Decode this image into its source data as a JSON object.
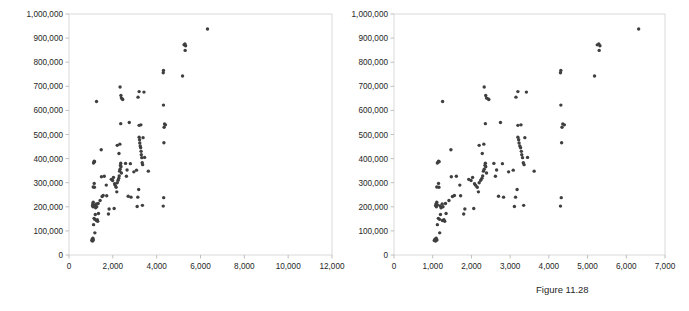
{
  "caption": "Figure 11.28",
  "chart_data": [
    {
      "type": "scatter",
      "id": "left-scatter",
      "title": "",
      "xlabel": "",
      "ylabel": "",
      "xlim": [
        0,
        12000
      ],
      "ylim": [
        0,
        1000000
      ],
      "xticks": [
        0,
        2000,
        4000,
        6000,
        8000,
        10000,
        12000
      ],
      "xticklabels": [
        "0",
        "2,000",
        "4,000",
        "6,000",
        "8,000",
        "10,000",
        "12,000"
      ],
      "yticks": [
        0,
        100000,
        200000,
        300000,
        400000,
        500000,
        600000,
        700000,
        800000,
        900000,
        1000000
      ],
      "yticklabels": [
        "0",
        "100,000",
        "200,000",
        "300,000",
        "400,000",
        "500,000",
        "600,000",
        "700,000",
        "800,000",
        "900,000",
        "1,000,000"
      ],
      "grid": false,
      "legend": null,
      "marker_color": "#3f3f3f",
      "points": [
        [
          1040,
          60000
        ],
        [
          1060,
          66000
        ],
        [
          1075,
          58000
        ],
        [
          1090,
          70000
        ],
        [
          1110,
          62000
        ],
        [
          1180,
          92000
        ],
        [
          1120,
          126000
        ],
        [
          1145,
          152000
        ],
        [
          1175,
          148000
        ],
        [
          1200,
          168000
        ],
        [
          1250,
          143000
        ],
        [
          1290,
          146000
        ],
        [
          1310,
          140000
        ],
        [
          1345,
          172000
        ],
        [
          1075,
          205000
        ],
        [
          1085,
          212000
        ],
        [
          1095,
          200000
        ],
        [
          1105,
          219000
        ],
        [
          1120,
          208000
        ],
        [
          1190,
          204000
        ],
        [
          1215,
          196000
        ],
        [
          1245,
          212000
        ],
        [
          1265,
          200000
        ],
        [
          1330,
          214000
        ],
        [
          1420,
          226000
        ],
        [
          1510,
          243000
        ],
        [
          1560,
          247000
        ],
        [
          1105,
          282000
        ],
        [
          1150,
          297000
        ],
        [
          1160,
          281000
        ],
        [
          1480,
          325000
        ],
        [
          1610,
          327000
        ],
        [
          1700,
          290000
        ],
        [
          1720,
          246000
        ],
        [
          1470,
          437000
        ],
        [
          1255,
          637000
        ],
        [
          1120,
          382000
        ],
        [
          1150,
          389000
        ],
        [
          1165,
          387000
        ],
        [
          1800,
          170000
        ],
        [
          1830,
          191000
        ],
        [
          2060,
          193000
        ],
        [
          1930,
          314000
        ],
        [
          1990,
          309000
        ],
        [
          2030,
          322000
        ],
        [
          2080,
          296000
        ],
        [
          2110,
          289000
        ],
        [
          2150,
          281000
        ],
        [
          2180,
          262000
        ],
        [
          2200,
          300000
        ],
        [
          2240,
          310000
        ],
        [
          2270,
          318000
        ],
        [
          2290,
          328000
        ],
        [
          2310,
          348000
        ],
        [
          2330,
          356000
        ],
        [
          2350,
          372000
        ],
        [
          2360,
          381000
        ],
        [
          2370,
          366000
        ],
        [
          2390,
          340000
        ],
        [
          2280,
          421000
        ],
        [
          2200,
          455000
        ],
        [
          2320,
          460000
        ],
        [
          2360,
          545000
        ],
        [
          2330,
          697000
        ],
        [
          2370,
          662000
        ],
        [
          2390,
          651000
        ],
        [
          2430,
          648000
        ],
        [
          2450,
          645000
        ],
        [
          2580,
          380000
        ],
        [
          2620,
          327000
        ],
        [
          2650,
          353000
        ],
        [
          2700,
          244000
        ],
        [
          2750,
          550000
        ],
        [
          2800,
          379000
        ],
        [
          2830,
          240000
        ],
        [
          2960,
          345000
        ],
        [
          3080,
          352000
        ],
        [
          3110,
          201000
        ],
        [
          3140,
          240000
        ],
        [
          3180,
          272000
        ],
        [
          3200,
          489000
        ],
        [
          3220,
          478000
        ],
        [
          3230,
          465000
        ],
        [
          3250,
          452000
        ],
        [
          3270,
          445000
        ],
        [
          3290,
          430000
        ],
        [
          3300,
          416000
        ],
        [
          3320,
          404000
        ],
        [
          3340,
          383000
        ],
        [
          3360,
          375000
        ],
        [
          3200,
          538000
        ],
        [
          3280,
          540000
        ],
        [
          3150,
          655000
        ],
        [
          3200,
          678000
        ],
        [
          3420,
          676000
        ],
        [
          3380,
          487000
        ],
        [
          3450,
          405000
        ],
        [
          3350,
          206000
        ],
        [
          3620,
          348000
        ],
        [
          4300,
          203000
        ],
        [
          4320,
          238000
        ],
        [
          4330,
          466000
        ],
        [
          4340,
          530000
        ],
        [
          4360,
          544000
        ],
        [
          4400,
          540000
        ],
        [
          4310,
          622000
        ],
        [
          4300,
          756000
        ],
        [
          4310,
          766000
        ],
        [
          5180,
          743000
        ],
        [
          5250,
          872000
        ],
        [
          5290,
          876000
        ],
        [
          5320,
          868000
        ],
        [
          5300,
          849000
        ],
        [
          6320,
          938000
        ]
      ]
    },
    {
      "type": "scatter",
      "id": "right-scatter",
      "title": "",
      "xlabel": "",
      "ylabel": "",
      "xlim": [
        0,
        7000
      ],
      "ylim": [
        0,
        1000000
      ],
      "xticks": [
        0,
        1000,
        2000,
        3000,
        4000,
        5000,
        6000,
        7000
      ],
      "xticklabels": [
        "0",
        "1,000",
        "2,000",
        "3,000",
        "4,000",
        "5,000",
        "6,000",
        "7,000"
      ],
      "yticks": [
        0,
        100000,
        200000,
        300000,
        400000,
        500000,
        600000,
        700000,
        800000,
        900000,
        1000000
      ],
      "yticklabels": [
        "0",
        "100,000",
        "200,000",
        "300,000",
        "400,000",
        "500,000",
        "600,000",
        "700,000",
        "800,000",
        "900,000",
        "1,000,000"
      ],
      "grid": false,
      "legend": null,
      "marker_color": "#3f3f3f",
      "points": [
        [
          1040,
          60000
        ],
        [
          1060,
          66000
        ],
        [
          1075,
          58000
        ],
        [
          1090,
          70000
        ],
        [
          1110,
          62000
        ],
        [
          1180,
          92000
        ],
        [
          1120,
          126000
        ],
        [
          1145,
          152000
        ],
        [
          1175,
          148000
        ],
        [
          1200,
          168000
        ],
        [
          1250,
          143000
        ],
        [
          1290,
          146000
        ],
        [
          1310,
          140000
        ],
        [
          1345,
          172000
        ],
        [
          1075,
          205000
        ],
        [
          1085,
          212000
        ],
        [
          1095,
          200000
        ],
        [
          1105,
          219000
        ],
        [
          1120,
          208000
        ],
        [
          1190,
          204000
        ],
        [
          1215,
          196000
        ],
        [
          1245,
          212000
        ],
        [
          1265,
          200000
        ],
        [
          1330,
          214000
        ],
        [
          1420,
          226000
        ],
        [
          1510,
          243000
        ],
        [
          1560,
          247000
        ],
        [
          1105,
          282000
        ],
        [
          1150,
          297000
        ],
        [
          1160,
          281000
        ],
        [
          1480,
          325000
        ],
        [
          1610,
          327000
        ],
        [
          1700,
          290000
        ],
        [
          1720,
          246000
        ],
        [
          1470,
          437000
        ],
        [
          1255,
          637000
        ],
        [
          1120,
          382000
        ],
        [
          1150,
          389000
        ],
        [
          1165,
          387000
        ],
        [
          1800,
          170000
        ],
        [
          1830,
          191000
        ],
        [
          2060,
          193000
        ],
        [
          1930,
          314000
        ],
        [
          1990,
          309000
        ],
        [
          2030,
          322000
        ],
        [
          2080,
          296000
        ],
        [
          2110,
          289000
        ],
        [
          2150,
          281000
        ],
        [
          2180,
          262000
        ],
        [
          2200,
          300000
        ],
        [
          2240,
          310000
        ],
        [
          2270,
          318000
        ],
        [
          2290,
          328000
        ],
        [
          2310,
          348000
        ],
        [
          2330,
          356000
        ],
        [
          2350,
          372000
        ],
        [
          2360,
          381000
        ],
        [
          2370,
          366000
        ],
        [
          2390,
          340000
        ],
        [
          2280,
          421000
        ],
        [
          2200,
          455000
        ],
        [
          2320,
          460000
        ],
        [
          2360,
          545000
        ],
        [
          2330,
          697000
        ],
        [
          2370,
          662000
        ],
        [
          2390,
          651000
        ],
        [
          2430,
          648000
        ],
        [
          2450,
          645000
        ],
        [
          2580,
          380000
        ],
        [
          2620,
          327000
        ],
        [
          2650,
          353000
        ],
        [
          2700,
          244000
        ],
        [
          2750,
          550000
        ],
        [
          2800,
          379000
        ],
        [
          2830,
          240000
        ],
        [
          2960,
          345000
        ],
        [
          3080,
          352000
        ],
        [
          3110,
          201000
        ],
        [
          3140,
          240000
        ],
        [
          3180,
          272000
        ],
        [
          3200,
          489000
        ],
        [
          3220,
          478000
        ],
        [
          3230,
          465000
        ],
        [
          3250,
          452000
        ],
        [
          3270,
          445000
        ],
        [
          3290,
          430000
        ],
        [
          3300,
          416000
        ],
        [
          3320,
          404000
        ],
        [
          3340,
          383000
        ],
        [
          3360,
          375000
        ],
        [
          3200,
          538000
        ],
        [
          3280,
          540000
        ],
        [
          3150,
          655000
        ],
        [
          3200,
          678000
        ],
        [
          3420,
          676000
        ],
        [
          3380,
          487000
        ],
        [
          3450,
          405000
        ],
        [
          3350,
          206000
        ],
        [
          3620,
          348000
        ],
        [
          4300,
          203000
        ],
        [
          4320,
          238000
        ],
        [
          4330,
          466000
        ],
        [
          4340,
          530000
        ],
        [
          4360,
          544000
        ],
        [
          4400,
          540000
        ],
        [
          4310,
          622000
        ],
        [
          4300,
          756000
        ],
        [
          4310,
          766000
        ],
        [
          5180,
          743000
        ],
        [
          5250,
          872000
        ],
        [
          5290,
          876000
        ],
        [
          5320,
          868000
        ],
        [
          5300,
          849000
        ],
        [
          6320,
          938000
        ]
      ]
    }
  ]
}
